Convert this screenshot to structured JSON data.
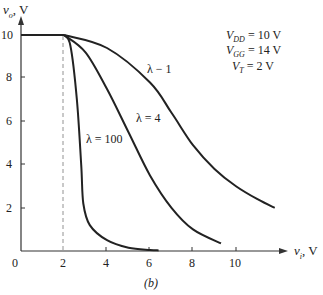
{
  "chart_data": {
    "type": "line",
    "title": "",
    "caption": "(b)",
    "xlabel": "v_i, V",
    "ylabel": "v_o, V",
    "xlim": [
      0,
      12
    ],
    "ylim": [
      0,
      10.5
    ],
    "xticks": [
      0,
      2,
      4,
      6,
      8,
      10
    ],
    "yticks": [
      2,
      4,
      6,
      8,
      10
    ],
    "grid": false,
    "dashed_marker": {
      "x": 2,
      "from_y": 0,
      "to_y": 10
    },
    "annotations": [
      {
        "text": "V_DD = 10 V"
      },
      {
        "text": "V_GG = 14 V"
      },
      {
        "text": "V_T = 2 V"
      }
    ],
    "series": [
      {
        "name": "λ = 100",
        "x": [
          0,
          2,
          2.3,
          2.6,
          2.8,
          2.9,
          3.2,
          4,
          5,
          6,
          6.4
        ],
        "y": [
          10,
          10,
          9.5,
          7,
          4,
          2.2,
          1.2,
          0.5,
          0.15,
          0.05,
          0.03
        ]
      },
      {
        "name": "λ = 4",
        "x": [
          0,
          2,
          3,
          4,
          5,
          6,
          7,
          8,
          9.3
        ],
        "y": [
          10,
          10,
          9.2,
          7.5,
          5.5,
          3.5,
          2.0,
          1.0,
          0.35
        ]
      },
      {
        "name": "λ = 1",
        "x": [
          0,
          2,
          4,
          6,
          7,
          8,
          9,
          10,
          11,
          11.8
        ],
        "y": [
          10,
          10,
          9.4,
          7.8,
          6.4,
          4.9,
          3.8,
          3.0,
          2.4,
          2.0
        ]
      }
    ]
  },
  "labels": {
    "y_axis": "v",
    "y_axis_sub": "o",
    "y_axis_unit": ", V",
    "x_axis": "v",
    "x_axis_sub": "i",
    "x_axis_unit": ", V",
    "caption": "(b)",
    "origin": "0",
    "x_ticks": [
      "2",
      "4",
      "6",
      "8",
      "10"
    ],
    "y_ticks": [
      "10",
      "8",
      "6",
      "4",
      "2"
    ],
    "curve_100": "λ = 100",
    "curve_4": "λ = 4",
    "curve_1": "λ − 1",
    "params": [
      {
        "sym": "V",
        "sub": "DD",
        "val": " = 10 V"
      },
      {
        "sym": "V",
        "sub": "GG",
        "val": " = 14 V"
      },
      {
        "sym": "V",
        "sub": "T",
        "val": " = 2 V"
      }
    ]
  }
}
